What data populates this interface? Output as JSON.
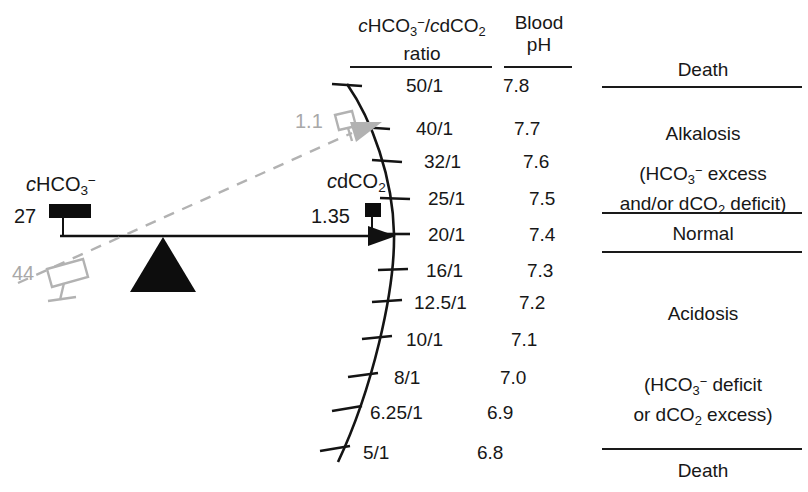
{
  "figure": {
    "colors": {
      "ink": "#171717",
      "gray": "#a8a8a8",
      "background": "#ffffff"
    }
  },
  "headers": {
    "ratio_line1_prefix": "c",
    "ratio_line1": "cHCO3−/cdCO2",
    "ratio_line2": "ratio",
    "ph_line1": "Blood",
    "ph_line2": "pH"
  },
  "scale": {
    "ratio_label": "cHCO3-/cdCO2 ratio",
    "ph_label": "Blood pH",
    "rows": [
      {
        "ratio": "50/1",
        "ph": "7.8"
      },
      {
        "ratio": "40/1",
        "ph": "7.7"
      },
      {
        "ratio": "32/1",
        "ph": "7.6"
      },
      {
        "ratio": "25/1",
        "ph": "7.5"
      },
      {
        "ratio": "20/1",
        "ph": "7.4"
      },
      {
        "ratio": "16/1",
        "ph": "7.3"
      },
      {
        "ratio": "12.5/1",
        "ph": "7.2"
      },
      {
        "ratio": "10/1",
        "ph": "7.1"
      },
      {
        "ratio": "8/1",
        "ph": "7.0"
      },
      {
        "ratio": "6.25/1",
        "ph": "6.9"
      },
      {
        "ratio": "5/1",
        "ph": "6.8"
      }
    ]
  },
  "bands": [
    {
      "name": "death-top",
      "lines": [
        "Death"
      ]
    },
    {
      "name": "alkalosis",
      "lines": [
        "Alkalosis"
      ]
    },
    {
      "name": "alkalosis-note",
      "lines": [
        "(HCO3− excess",
        "and/or dCO2 deficit)"
      ]
    },
    {
      "name": "normal",
      "lines": [
        "Normal"
      ]
    },
    {
      "name": "acidosis",
      "lines": [
        "Acidosis"
      ]
    },
    {
      "name": "acidosis-note",
      "lines": [
        "(HCO3− deficit",
        "or dCO2 excess)"
      ]
    },
    {
      "name": "death-bottom",
      "lines": [
        "Death"
      ]
    }
  ],
  "balance": {
    "bicarbonate_label": "cHCO3−",
    "bicarbonate_value": "27",
    "bicarbonate_value_alt": "44",
    "dco2_label": "cdCO2",
    "dco2_value": "1.35",
    "dco2_value_alt": "1.1"
  }
}
